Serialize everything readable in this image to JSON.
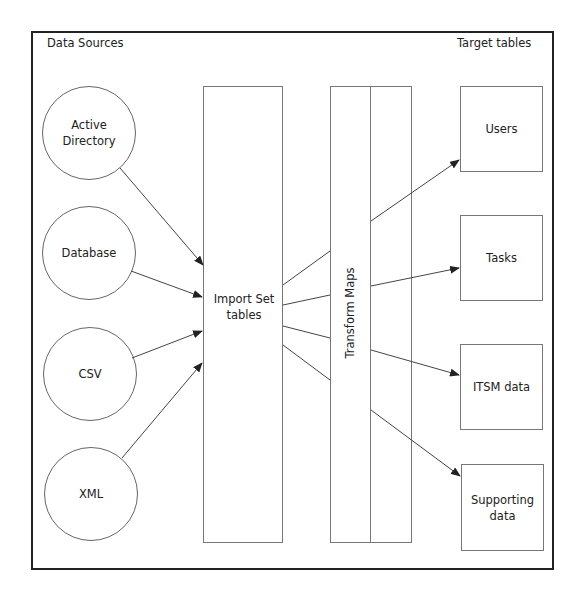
{
  "diagram": {
    "headers": {
      "left": "Data Sources",
      "right": "Target tables"
    },
    "sources": [
      {
        "id": "active-directory",
        "label": "Active\nDirectory",
        "lines": [
          "Active",
          "Directory"
        ]
      },
      {
        "id": "database",
        "label": "Database",
        "lines": [
          "Database"
        ]
      },
      {
        "id": "csv",
        "label": "CSV",
        "lines": [
          "CSV"
        ]
      },
      {
        "id": "xml",
        "label": "XML",
        "lines": [
          "XML"
        ]
      }
    ],
    "staging": {
      "label_line1": "Import Set",
      "label_line2": "tables"
    },
    "transform": {
      "label": "Transform Maps"
    },
    "targets": [
      {
        "id": "users",
        "lines": [
          "Users"
        ]
      },
      {
        "id": "tasks",
        "lines": [
          "Tasks"
        ]
      },
      {
        "id": "itsm-data",
        "lines": [
          "ITSM data"
        ]
      },
      {
        "id": "supporting-data",
        "lines": [
          "Supporting",
          "data"
        ]
      }
    ],
    "edges": [
      {
        "from": "Active Directory",
        "to": "Import Set tables",
        "arrow": true
      },
      {
        "from": "Database",
        "to": "Import Set tables",
        "arrow": true
      },
      {
        "from": "CSV",
        "to": "Import Set tables",
        "arrow": true
      },
      {
        "from": "XML",
        "to": "Import Set tables",
        "arrow": true
      },
      {
        "from": "Import Set tables",
        "to": "Transform Maps",
        "arrow": false,
        "count": 4
      },
      {
        "from": "Transform Maps",
        "to": "Users",
        "arrow": true
      },
      {
        "from": "Transform Maps",
        "to": "Tasks",
        "arrow": true
      },
      {
        "from": "Transform Maps",
        "to": "ITSM data",
        "arrow": true
      },
      {
        "from": "Transform Maps",
        "to": "Supporting data",
        "arrow": true
      }
    ],
    "colors": {
      "frame": "#222222",
      "stroke": "#666666",
      "text": "#222222",
      "background": "#ffffff"
    }
  }
}
